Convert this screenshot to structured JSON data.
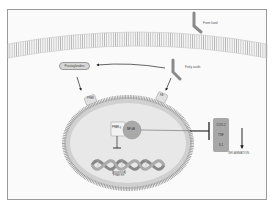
{
  "diagram": {
    "labels": {
      "from_food": "From food",
      "prostaglandins": "Prostaglandins",
      "fatty_acids": "Fatty acids",
      "receptor_left": "PPAR",
      "receptor_right": "FA",
      "ppar": "PPAR-γ",
      "nfkb": "NF-kB",
      "ppar_re": "PPAR RE",
      "inflammation": "INFLAMMATION"
    },
    "cytokines": [
      "COX-2",
      "TNF",
      "IL1"
    ],
    "colors": {
      "membrane": "#bdbdbd",
      "nucleus_fill": "#e8e8e8",
      "nfkb_fill": "#a9a9a9",
      "box_fill": "#a8a8a8",
      "arrow": "#222222"
    }
  }
}
